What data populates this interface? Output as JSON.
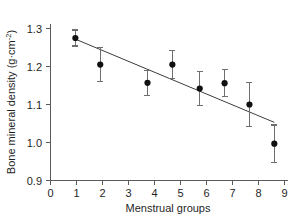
{
  "chart_data": {
    "type": "scatter",
    "title": "",
    "subtitle": "",
    "xlabel": "Menstrual groups",
    "ylabel": "Bone mineral density (g·cm⁻²)",
    "ylabel_main": "Bone mineral density (g",
    "ylabel_mid": "cm",
    "ylabel_sup": "-2",
    "ylabel_close": ")",
    "ylabel_dot": "·",
    "xlim": [
      0,
      9.55
    ],
    "ylim": [
      0.9,
      1.315
    ],
    "xticks": [
      0,
      1,
      2,
      3,
      4,
      5,
      6,
      7,
      8,
      9
    ],
    "xticklabels": [
      "0",
      "1",
      "2",
      "3",
      "4",
      "5",
      "6",
      "7",
      "8",
      "9"
    ],
    "yticks": [
      0.9,
      1.0,
      1.1,
      1.2,
      1.3
    ],
    "yticklabels": [
      "0.9",
      "1.0",
      "1.1",
      "1.2",
      "1.3"
    ],
    "grid": false,
    "legend": "none",
    "x": [
      1.0,
      2.0,
      3.9,
      4.9,
      6.0,
      7.0,
      8.0,
      9.0
    ],
    "values": [
      1.275,
      1.205,
      1.157,
      1.205,
      1.142,
      1.156,
      1.1,
      0.997
    ],
    "yerr": [
      0.021,
      0.045,
      0.033,
      0.036,
      0.044,
      0.035,
      0.059,
      0.049
    ],
    "points": [
      {
        "group": "1",
        "x": 1.0,
        "y": 1.275,
        "err": 0.021
      },
      {
        "group": "2",
        "x": 2.0,
        "y": 1.205,
        "err": 0.045
      },
      {
        "group": "4",
        "x": 3.9,
        "y": 1.157,
        "err": 0.033
      },
      {
        "group": "5",
        "x": 4.9,
        "y": 1.205,
        "err": 0.036
      },
      {
        "group": "6",
        "x": 6.0,
        "y": 1.142,
        "err": 0.044
      },
      {
        "group": "7",
        "x": 7.0,
        "y": 1.156,
        "err": 0.035
      },
      {
        "group": "8",
        "x": 8.0,
        "y": 1.1,
        "err": 0.059
      },
      {
        "group": "9",
        "x": 9.0,
        "y": 0.997,
        "err": 0.049
      }
    ],
    "trendline": {
      "x0": 1.0,
      "y0": 1.272,
      "x1": 9.0,
      "y1": 1.053
    },
    "colors": {
      "marker": "#111111",
      "line": "#2b2b2b",
      "errorbar": "#6e6e6e",
      "axis": "#5a5a5a",
      "background": "#ffffff",
      "text": "#1f1f1f"
    }
  }
}
